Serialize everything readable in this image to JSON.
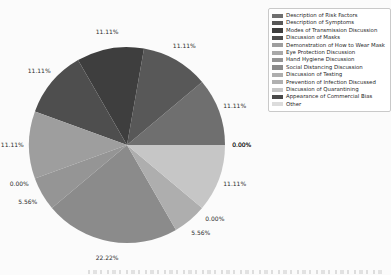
{
  "chart_data": {
    "type": "pie",
    "title": "",
    "categories": [
      "Description of Risk Factors",
      "Description of Symptoms",
      "Modes of Transmission Discussion",
      "Discussion of Masks",
      "Demonstration of How to Wear Mask",
      "Eye Protection Discussion",
      "Hand Hygiene Discussion",
      "Social Distancing Discussion",
      "Discussion of Testing",
      "Prevention of Infection Discussed",
      "Discussion of Quarantining",
      "Appearance of Commercial Bias",
      "Other"
    ],
    "values": [
      11.11,
      11.11,
      11.11,
      11.11,
      11.11,
      0.0,
      5.56,
      22.22,
      5.56,
      0.0,
      11.11,
      0.0,
      0.0
    ],
    "slice_labels": [
      "11.11%",
      "11.11%",
      "11.11%",
      "11.11%",
      "11.11%",
      "0.00%",
      "5.56%",
      "22.22%",
      "5.56%",
      "0.00%",
      "11.11%",
      "0.00%",
      "0.00%"
    ],
    "colors": [
      "#6f6f6f",
      "#585858",
      "#3e3e3e",
      "#4e4e4e",
      "#9e9e9e",
      "#a9a9a9",
      "#959595",
      "#8b8b8b",
      "#aeaeae",
      "#b0b0b0",
      "#c6c6c6",
      "#4a4a4a",
      "#dcdcdc"
    ],
    "start_angle_deg": 0,
    "direction": "counterclockwise",
    "legend_position": "upper right",
    "grid": "off",
    "percent_label_color": "#2b2b2b",
    "legend_text_color": "#1f1f1f",
    "legend_border_color": "#c9c9c9",
    "background_color": "#fbfbfb"
  }
}
